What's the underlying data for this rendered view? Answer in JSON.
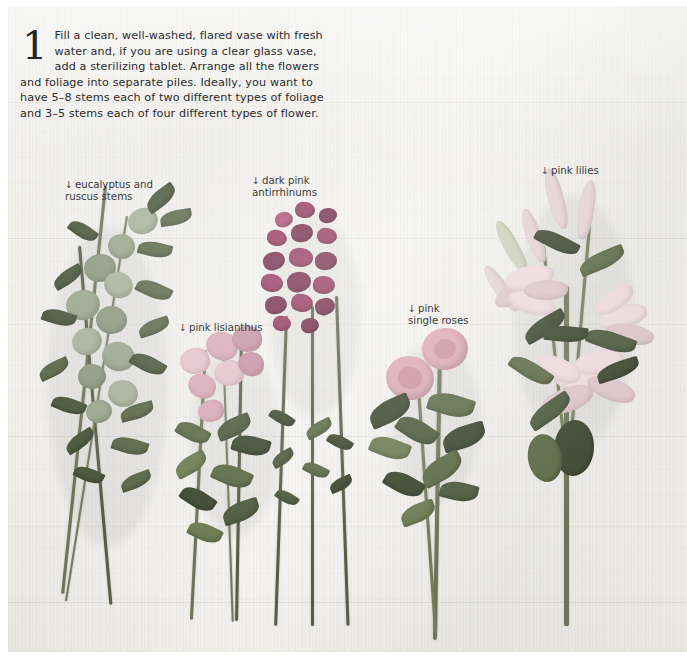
{
  "page": {
    "background_color": "#ffffff",
    "plate_color": "#f1f0ed"
  },
  "caption": {
    "step_number": "1",
    "text": "Fill a clean, well-washed, flared vase with fresh water and, if you are using a clear glass vase, add a sterilizing tablet. Arrange all the flowers and foliage into separate piles. Ideally, you want to have 5–8 stems each of two different types of foliage and 3–5 stems each of four different types of flower."
  },
  "annotations": [
    {
      "id": "eucalyptus-ruscus",
      "arrow": "↓",
      "text": "eucalyptus and\nruscus stems",
      "left": 57,
      "top": 160
    },
    {
      "id": "dark-pink-antirrhinums",
      "arrow": "↓",
      "text": "dark pink\nantirrhinums",
      "left": 244,
      "top": 156
    },
    {
      "id": "pink-lisianthus",
      "arrow": "↓",
      "text": "pink lisianthus",
      "left": 171,
      "top": 303
    },
    {
      "id": "pink-single-roses",
      "arrow": "↓",
      "text": "pink\nsingle roses",
      "left": 400,
      "top": 284
    },
    {
      "id": "pink-lilies",
      "arrow": "↓",
      "text": "pink lilies",
      "left": 533,
      "top": 146
    }
  ],
  "flower_groups": [
    {
      "id": "foliage-pile",
      "name": "eucalyptus and ruscus stems",
      "color": "#6d7357"
    },
    {
      "id": "lisianthus-pile",
      "name": "pink lisianthus",
      "color": "#d9a8b8"
    },
    {
      "id": "antirrhinum-pile",
      "name": "dark pink antirrhinums",
      "color": "#8e2f55"
    },
    {
      "id": "rose-pile",
      "name": "pink single roses",
      "color": "#dba7b2"
    },
    {
      "id": "lily-pile",
      "name": "pink lilies",
      "color": "#ecd9dd"
    }
  ]
}
